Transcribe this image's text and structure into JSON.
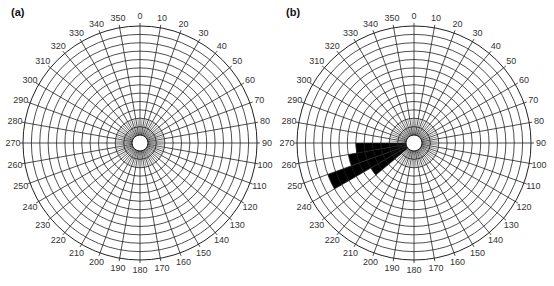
{
  "chart_data": [
    {
      "type": "polar-rose",
      "panel_label": "(a)",
      "title": "",
      "angular_ticks": [
        0,
        10,
        20,
        30,
        40,
        50,
        60,
        70,
        80,
        90,
        100,
        110,
        120,
        130,
        140,
        150,
        160,
        170,
        180,
        190,
        200,
        210,
        220,
        230,
        240,
        250,
        260,
        270,
        280,
        290,
        300,
        310,
        320,
        330,
        340,
        350
      ],
      "rings": 14,
      "grid": true,
      "sectors": []
    },
    {
      "type": "polar-rose",
      "panel_label": "(b)",
      "title": "",
      "angular_ticks": [
        0,
        10,
        20,
        30,
        40,
        50,
        60,
        70,
        80,
        90,
        100,
        110,
        120,
        130,
        140,
        150,
        160,
        170,
        180,
        190,
        200,
        210,
        220,
        230,
        240,
        250,
        260,
        270,
        280,
        290,
        300,
        310,
        320,
        330,
        340,
        350
      ],
      "rings": 14,
      "grid": true,
      "sectors": [
        {
          "from": 230,
          "to": 240,
          "radius_rings": 5
        },
        {
          "from": 240,
          "to": 250,
          "radius_rings": 10
        },
        {
          "from": 250,
          "to": 260,
          "radius_rings": 7
        },
        {
          "from": 260,
          "to": 270,
          "radius_rings": 6
        }
      ]
    }
  ],
  "colors": {
    "grid": "#222222",
    "fill": "#000000",
    "text": "#333333"
  }
}
